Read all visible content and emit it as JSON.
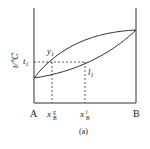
{
  "diagram": {
    "type": "binary-phase-diagram",
    "caption": "(a)",
    "y_axis_label": "t/℃",
    "left_component": "A",
    "right_component": "B",
    "temperature_label": "t",
    "temperature_sub": "1",
    "vapor_curve_label": "y",
    "vapor_curve_sub": "1",
    "liquid_curve_label": "l",
    "liquid_curve_sub": "1",
    "vapor_composition": {
      "base": "x",
      "sub": "B",
      "sup": "g"
    },
    "liquid_composition": {
      "base": "x",
      "sub": "B",
      "sup": "l"
    }
  }
}
